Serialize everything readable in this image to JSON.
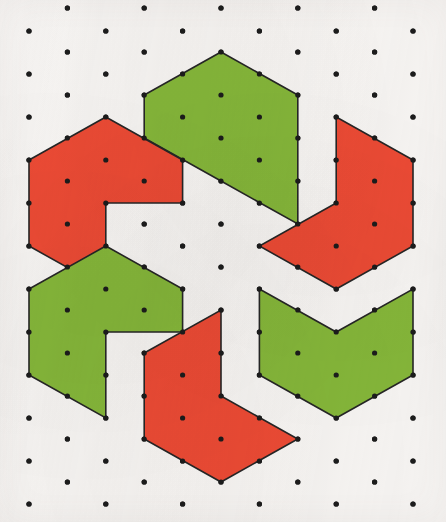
{
  "figure": {
    "width": 446,
    "height": 522,
    "background_color": "#f9f7f5",
    "outline_color": "#262626",
    "dot_color": "#1c1c1c",
    "dot_radius": 2.6
  },
  "palette": {
    "red": "#ee4b35",
    "green": "#86b83a",
    "red_label": "red",
    "green_label": "green"
  },
  "lattice": {
    "type": "triangular",
    "center": [
      219,
      263
    ],
    "column_spacing": 38.4,
    "row_spacing": 43.0,
    "columns_x": [
      29,
      67.4,
      105.8,
      144.2,
      182.6,
      221,
      259.4,
      297.8,
      336.2,
      374.6,
      413
    ],
    "dots": [
      [
        67.4,
        8
      ],
      [
        144.2,
        8
      ],
      [
        221,
        8
      ],
      [
        297.8,
        8
      ],
      [
        374.6,
        8
      ],
      [
        29,
        31
      ],
      [
        105.8,
        31
      ],
      [
        182.6,
        31
      ],
      [
        259.4,
        31
      ],
      [
        336.2,
        31
      ],
      [
        413,
        31
      ],
      [
        67.4,
        52
      ],
      [
        144.2,
        52
      ],
      [
        221,
        52
      ],
      [
        297.8,
        52
      ],
      [
        374.6,
        52
      ],
      [
        29,
        74
      ],
      [
        105.8,
        74
      ],
      [
        182.6,
        74
      ],
      [
        259.4,
        74
      ],
      [
        336.2,
        74
      ],
      [
        413,
        74
      ],
      [
        67.4,
        95
      ],
      [
        144.2,
        95
      ],
      [
        221,
        95
      ],
      [
        297.8,
        95
      ],
      [
        374.6,
        95
      ],
      [
        29,
        117
      ],
      [
        105.8,
        117
      ],
      [
        182.6,
        117
      ],
      [
        259.4,
        117
      ],
      [
        336.2,
        117
      ],
      [
        413,
        117
      ],
      [
        67.4,
        138
      ],
      [
        144.2,
        138
      ],
      [
        221,
        138
      ],
      [
        297.8,
        138
      ],
      [
        374.6,
        138
      ],
      [
        29,
        160
      ],
      [
        105.8,
        160
      ],
      [
        182.6,
        160
      ],
      [
        259.4,
        160
      ],
      [
        336.2,
        160
      ],
      [
        413,
        160
      ],
      [
        67.4,
        181
      ],
      [
        144.2,
        181
      ],
      [
        221,
        181
      ],
      [
        297.8,
        181
      ],
      [
        374.6,
        181
      ],
      [
        29,
        203
      ],
      [
        105.8,
        203
      ],
      [
        182.6,
        203
      ],
      [
        259.4,
        203
      ],
      [
        336.2,
        203
      ],
      [
        413,
        203
      ],
      [
        67.4,
        224
      ],
      [
        144.2,
        224
      ],
      [
        221,
        224
      ],
      [
        297.8,
        224
      ],
      [
        374.6,
        224
      ],
      [
        29,
        246
      ],
      [
        105.8,
        246
      ],
      [
        182.6,
        246
      ],
      [
        259.4,
        246
      ],
      [
        336.2,
        246
      ],
      [
        413,
        246
      ],
      [
        67.4,
        267
      ],
      [
        144.2,
        267
      ],
      [
        221,
        267
      ],
      [
        297.8,
        267
      ],
      [
        374.6,
        267
      ],
      [
        29,
        289
      ],
      [
        105.8,
        289
      ],
      [
        182.6,
        289
      ],
      [
        259.4,
        289
      ],
      [
        336.2,
        289
      ],
      [
        413,
        289
      ],
      [
        67.4,
        310
      ],
      [
        144.2,
        310
      ],
      [
        221,
        310
      ],
      [
        297.8,
        310
      ],
      [
        374.6,
        310
      ],
      [
        29,
        332
      ],
      [
        105.8,
        332
      ],
      [
        182.6,
        332
      ],
      [
        259.4,
        332
      ],
      [
        336.2,
        332
      ],
      [
        413,
        332
      ],
      [
        67.4,
        353
      ],
      [
        144.2,
        353
      ],
      [
        221,
        353
      ],
      [
        297.8,
        353
      ],
      [
        374.6,
        353
      ],
      [
        29,
        375
      ],
      [
        105.8,
        375
      ],
      [
        182.6,
        375
      ],
      [
        259.4,
        375
      ],
      [
        336.2,
        375
      ],
      [
        413,
        375
      ],
      [
        67.4,
        396
      ],
      [
        144.2,
        396
      ],
      [
        221,
        396
      ],
      [
        297.8,
        396
      ],
      [
        374.6,
        396
      ],
      [
        29,
        418
      ],
      [
        105.8,
        418
      ],
      [
        182.6,
        418
      ],
      [
        259.4,
        418
      ],
      [
        336.2,
        418
      ],
      [
        413,
        418
      ],
      [
        67.4,
        439
      ],
      [
        144.2,
        439
      ],
      [
        221,
        439
      ],
      [
        297.8,
        439
      ],
      [
        374.6,
        439
      ],
      [
        29,
        461
      ],
      [
        105.8,
        461
      ],
      [
        182.6,
        461
      ],
      [
        259.4,
        461
      ],
      [
        336.2,
        461
      ],
      [
        413,
        461
      ],
      [
        67.4,
        482
      ],
      [
        144.2,
        482
      ],
      [
        221,
        482
      ],
      [
        297.8,
        482
      ],
      [
        374.6,
        482
      ],
      [
        29,
        504
      ],
      [
        105.8,
        504
      ],
      [
        182.6,
        504
      ],
      [
        259.4,
        504
      ],
      [
        336.2,
        504
      ],
      [
        413,
        504
      ]
    ]
  },
  "pieces": [
    {
      "id": "piece-top-green",
      "name": "top-green-chevron",
      "color_key": "green",
      "fill": "#86b83a",
      "position_label": "top",
      "orientation_degrees": 0,
      "points": "221,52 297.8,95 297.8,181 297.8,224 221,181 144.2,138 144.2,95"
    },
    {
      "id": "piece-left-red",
      "name": "left-red-chevron",
      "color_key": "red",
      "fill": "#ee4b35",
      "position_label": "upper-left",
      "orientation_degrees": 300,
      "points": "105.8,117 182.6,160 182.6,203 105.8,203 105.8,289 29,246 29,160"
    },
    {
      "id": "piece-right-red",
      "name": "right-red-chevron",
      "color_key": "red",
      "fill": "#ee4b35",
      "position_label": "upper-right",
      "orientation_degrees": 60,
      "points": "336.2,117 413,160 413,246 336.2,289 259.4,246 336.2,203"
    },
    {
      "id": "piece-leftlower-green",
      "name": "lower-left-green-chevron",
      "color_key": "green",
      "fill": "#86b83a",
      "position_label": "lower-left",
      "orientation_degrees": 240,
      "points": "29,289 105.8,246 182.6,289 182.6,332 105.8,332 105.8,418 29,375"
    },
    {
      "id": "piece-rightlower-green",
      "name": "lower-right-green-chevron",
      "color_key": "green",
      "fill": "#86b83a",
      "position_label": "lower-right",
      "orientation_degrees": 120,
      "points": "259.4,289 336.2,332 413,289 413,375 336.2,418 259.4,375"
    },
    {
      "id": "piece-bottom-red",
      "name": "bottom-red-chevron",
      "color_key": "red",
      "fill": "#ee4b35",
      "position_label": "bottom",
      "orientation_degrees": 180,
      "points": "221,310 221,396 297.8,439 221,482 144.2,439 144.2,353"
    }
  ]
}
